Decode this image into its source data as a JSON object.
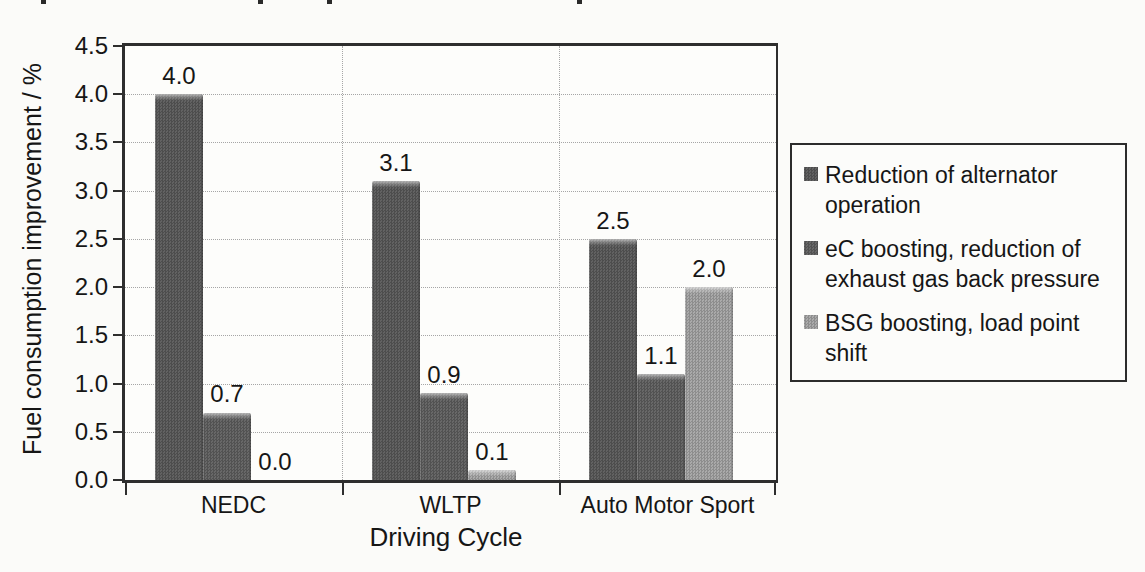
{
  "chart_data": {
    "type": "bar",
    "title": "",
    "xlabel": "Driving Cycle",
    "ylabel": "Fuel consumption improvement / %",
    "categories": [
      "NEDC",
      "WLTP",
      "Auto Motor Sport"
    ],
    "series": [
      {
        "name": "Reduction of alternator operation",
        "values": [
          4.0,
          3.1,
          2.5
        ],
        "color": "#575757",
        "checker": [
          "#4d4d4d",
          "#626262"
        ]
      },
      {
        "name": "eC boosting, reduction of exhaust gas back pressure",
        "values": [
          0.7,
          0.9,
          1.1
        ],
        "color": "#5c5c5c",
        "checker": [
          "#525252",
          "#686868"
        ]
      },
      {
        "name": "BSG boosting, load point shift",
        "values": [
          0.0,
          0.1,
          2.0
        ],
        "color": "#9b9b9b",
        "checker": [
          "#8d8d8d",
          "#aaaaaa"
        ]
      }
    ],
    "ylim": [
      0,
      4.5
    ],
    "ytick_step": 0.5,
    "grid": true,
    "legend_position": "right",
    "value_labels": true
  },
  "colors": {
    "background": "#fbfbf9",
    "axis": "#2e2e2e",
    "gridline": "#a6a6a6",
    "text": "#161616",
    "legend_border": "#2c2c2c"
  },
  "scan_artifacts": {
    "top_edge_marks_x": [
      41,
      258,
      327,
      577
    ]
  }
}
